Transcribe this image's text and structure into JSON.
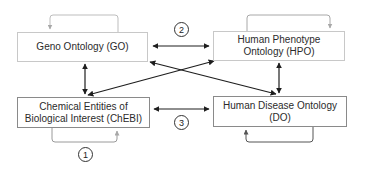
{
  "nodes": {
    "go": {
      "label": "Geno Ontology (GO)"
    },
    "hpo": {
      "label": "Human Phenotype Ontology (HPO)"
    },
    "chebi": {
      "label": "Chemical Entities of Biological Interest (ChEBI)"
    },
    "do": {
      "label": "Human Disease Ontology (DO)"
    }
  },
  "badges": {
    "one": "1",
    "two": "2",
    "three": "3"
  },
  "edges": [
    {
      "from": "go",
      "to": "hpo",
      "type": "bidirectional"
    },
    {
      "from": "go",
      "to": "chebi",
      "type": "bidirectional"
    },
    {
      "from": "go",
      "to": "do",
      "type": "bidirectional"
    },
    {
      "from": "hpo",
      "to": "chebi",
      "type": "bidirectional"
    },
    {
      "from": "hpo",
      "to": "do",
      "type": "bidirectional"
    },
    {
      "from": "chebi",
      "to": "do",
      "type": "bidirectional"
    },
    {
      "from": "go",
      "to": "go",
      "type": "self-loop"
    },
    {
      "from": "hpo",
      "to": "hpo",
      "type": "self-loop"
    },
    {
      "from": "chebi",
      "to": "chebi",
      "type": "self-loop"
    },
    {
      "from": "do",
      "to": "do",
      "type": "self-loop"
    }
  ],
  "colors": {
    "edge": "#1e1e1e",
    "loop_light": "#a8a8a8",
    "loop_dark": "#555555",
    "box_border": "#8a8a8a"
  }
}
